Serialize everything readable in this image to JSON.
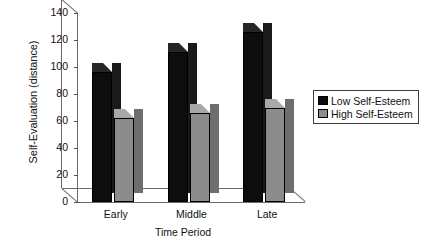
{
  "chart_data": {
    "type": "bar",
    "title": "",
    "subtitle": "",
    "xlabel": "Time Period",
    "ylabel": "Self-Evaluation (distance)",
    "categories": [
      "Early",
      "Middle",
      "Late"
    ],
    "series": [
      {
        "name": "Low Self-Esteem",
        "values": [
          96,
          111,
          126
        ],
        "color": "#0d0d0d"
      },
      {
        "name": "High Self-Esteem",
        "values": [
          62,
          66,
          70
        ],
        "color": "#8c8c8c"
      }
    ],
    "ylim": [
      0,
      140
    ],
    "yticks": [
      0,
      20,
      40,
      60,
      80,
      100,
      120,
      140
    ],
    "ytick_labels": [
      "0",
      "20",
      "40",
      "60",
      "80",
      "100",
      "120",
      "140"
    ],
    "grid": false,
    "legend_position": "right",
    "style": "3d-bar",
    "legend": [
      {
        "label": "Low Self-Esteem",
        "swatch": "low"
      },
      {
        "label": "High Self-Esteem",
        "swatch": "high"
      }
    ]
  }
}
